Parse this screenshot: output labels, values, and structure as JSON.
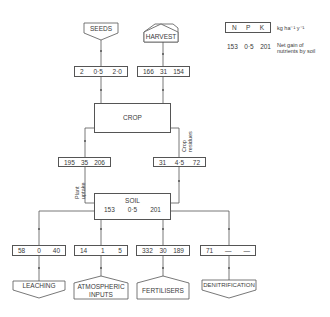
{
  "legend": {
    "headers": [
      "N",
      "P",
      "K"
    ],
    "units": "kg ha⁻¹ y⁻¹",
    "example_values": [
      "153",
      "0·5",
      "201"
    ],
    "example_note_line1": "Net gain of",
    "example_note_line2": "nutrients by soil"
  },
  "nodes": {
    "seeds": {
      "label": "SEEDS",
      "values": [
        "2",
        "0·5",
        "2·0"
      ]
    },
    "harvest": {
      "label": "HARVEST",
      "values": [
        "166",
        "31",
        "154"
      ]
    },
    "crop": {
      "label": "CROP"
    },
    "plant_uptake": {
      "label_line1": "Plant",
      "label_line2": "uptake",
      "values": [
        "195",
        "35",
        "206"
      ]
    },
    "crop_residues": {
      "label_line1": "Crop",
      "label_line2": "residues",
      "values": [
        "31",
        "4·5",
        "72"
      ]
    },
    "soil": {
      "label": "SOIL",
      "values": [
        "153",
        "0·5",
        "201"
      ]
    },
    "leaching": {
      "label": "LEACHING",
      "values": [
        "58",
        "0",
        "40"
      ]
    },
    "atmospheric": {
      "label_line1": "ATMOSPHERIC",
      "label_line2": "INPUTS",
      "values": [
        "14",
        "1",
        "5"
      ]
    },
    "fertilisers": {
      "label": "FERTILISERS",
      "values": [
        "332",
        "30",
        "189"
      ]
    },
    "denitrification": {
      "label": "DENITRIFICATION",
      "values": [
        "71",
        "—",
        "—"
      ]
    }
  }
}
